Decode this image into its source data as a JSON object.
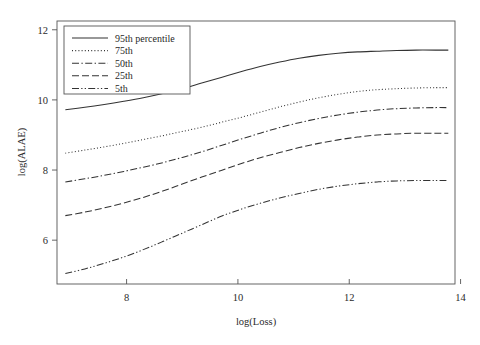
{
  "chart_data": {
    "type": "line",
    "title": "",
    "xlabel": "log(Loss)",
    "ylabel": "log(ALAE)",
    "xlim": [
      6.75,
      13.9
    ],
    "ylim": [
      4.75,
      12.25
    ],
    "xticks": [
      8,
      10,
      12,
      14
    ],
    "xticklabels": [
      "8",
      "10",
      "12",
      "14"
    ],
    "yticks": [
      6,
      8,
      10,
      12
    ],
    "yticklabels": [
      "6",
      "8",
      "10",
      "12"
    ],
    "grid": false,
    "legend_position": "upper left",
    "x": [
      6.9,
      7.25,
      7.6,
      7.95,
      8.3,
      8.65,
      9.0,
      9.35,
      9.7,
      10.05,
      10.4,
      10.75,
      11.1,
      11.45,
      11.8,
      12.15,
      12.5,
      12.85,
      13.2,
      13.55,
      13.78
    ],
    "series": [
      {
        "name": "95th percentile",
        "linestyle": "solid",
        "values": [
          9.72,
          9.79,
          9.87,
          9.96,
          10.06,
          10.18,
          10.32,
          10.48,
          10.64,
          10.8,
          10.95,
          11.08,
          11.19,
          11.27,
          11.33,
          11.37,
          11.39,
          11.41,
          11.42,
          11.42,
          11.42
        ]
      },
      {
        "name": "75th",
        "linestyle": "dotted",
        "values": [
          8.48,
          8.57,
          8.66,
          8.76,
          8.87,
          8.98,
          9.1,
          9.22,
          9.36,
          9.5,
          9.65,
          9.8,
          9.94,
          10.06,
          10.16,
          10.24,
          10.29,
          10.32,
          10.34,
          10.35,
          10.35
        ]
      },
      {
        "name": "50th",
        "linestyle": "dashdot",
        "values": [
          7.66,
          7.75,
          7.85,
          7.96,
          8.08,
          8.21,
          8.36,
          8.52,
          8.7,
          8.88,
          9.05,
          9.21,
          9.35,
          9.47,
          9.57,
          9.65,
          9.71,
          9.75,
          9.77,
          9.78,
          9.78
        ]
      },
      {
        "name": "25th",
        "linestyle": "dashed",
        "values": [
          6.7,
          6.8,
          6.92,
          7.06,
          7.22,
          7.4,
          7.6,
          7.8,
          7.99,
          8.18,
          8.35,
          8.5,
          8.64,
          8.76,
          8.86,
          8.94,
          9.0,
          9.03,
          9.05,
          9.05,
          9.05
        ]
      },
      {
        "name": "5th",
        "linestyle": "dashdotdot",
        "values": [
          5.05,
          5.18,
          5.34,
          5.52,
          5.73,
          5.96,
          6.2,
          6.44,
          6.68,
          6.88,
          7.05,
          7.2,
          7.33,
          7.45,
          7.54,
          7.61,
          7.66,
          7.69,
          7.7,
          7.7,
          7.7
        ]
      }
    ]
  },
  "legend": {
    "entries": [
      {
        "label": "95th percentile"
      },
      {
        "label": "75th"
      },
      {
        "label": "50th"
      },
      {
        "label": "25th"
      },
      {
        "label": "5th"
      }
    ]
  },
  "axes": {
    "x_title": "log(Loss)",
    "y_title": "log(ALAE)",
    "x_tick_labels": [
      "8",
      "10",
      "12",
      "14"
    ],
    "y_tick_labels": [
      "6",
      "8",
      "10",
      "12"
    ]
  },
  "style": {
    "line_color": "#333333",
    "axis_color": "#555555",
    "background": "#ffffff"
  }
}
